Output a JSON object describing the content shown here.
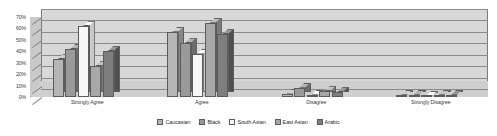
{
  "chart_data": {
    "type": "bar",
    "title": "",
    "subtitle": "",
    "xlabel": "",
    "ylabel": "",
    "ylim": [
      0,
      70
    ],
    "ytick_labels": [
      "0%",
      "10%",
      "20%",
      "30%",
      "40%",
      "50%",
      "60%",
      "70%"
    ],
    "ytick_values": [
      0,
      10,
      20,
      30,
      40,
      50,
      60,
      70
    ],
    "grid": true,
    "legend_position": "bottom",
    "style": "3d-grouped-bar",
    "categories": [
      "Strongly Agree",
      "Agree",
      "Disagree",
      "Strongly Disagree"
    ],
    "series": [
      {
        "name": "Caucasian",
        "color": "#b5b5b5",
        "values": [
          33,
          57,
          3,
          2
        ]
      },
      {
        "name": "Black",
        "color": "#9a9a9a",
        "values": [
          42,
          47,
          8,
          2
        ]
      },
      {
        "name": "South Asian",
        "color": "#f7f7f7",
        "values": [
          62,
          38,
          2,
          1
        ]
      },
      {
        "name": "East Asian",
        "color": "#a8a8a8",
        "values": [
          27,
          65,
          5,
          2
        ]
      },
      {
        "name": "Arabic",
        "color": "#7e7e7e",
        "values": [
          40,
          55,
          4,
          2
        ]
      }
    ]
  },
  "colors": {
    "plot_back_wall": "#d8d8d8",
    "plot_floor": "#cfcfcf",
    "plot_side_wall": "#c9c9c9",
    "gridline": "#8a8a8a",
    "axis_text": "#3a3a3a",
    "legend_text": "#2a2a2a",
    "bar_outline": "#5c5c5c",
    "background": "#ffffff"
  }
}
